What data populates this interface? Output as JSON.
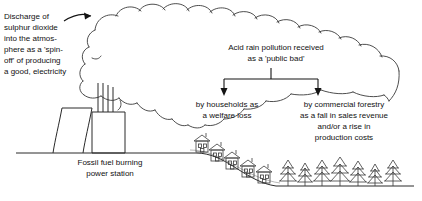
{
  "diagram": {
    "background_color": "#ffffff",
    "ink_color": "#1a1a1a",
    "labels": {
      "discharge": "Discharge of\nsulphur dioxide\ninto  the atmos-\nphere as a 'spin-\noff' of producing\na good, electricity",
      "acid_rain": "Acid rain pollution received\nas a 'public bad'",
      "households": "by households as\na welfare loss",
      "forestry": "by commercial forestry\nas a fall in sales revenue\nand/or a rise in\nproduction costs",
      "power_station": "Fossil fuel burning\npower station"
    },
    "elements": {
      "smoke_cloud": "smoke-cloud",
      "cooling_tower": "cooling-tower",
      "chimney_count": 3,
      "house_count": 5,
      "tree_count": 7,
      "ground_line": "ground-line",
      "hill_slope": "hill-slope",
      "curved_arrow": "curved-arrow-to-cloud",
      "bracket": "distribution-bracket",
      "arrow_left": "arrow-to-households",
      "arrow_right": "arrow-to-forestry"
    }
  }
}
